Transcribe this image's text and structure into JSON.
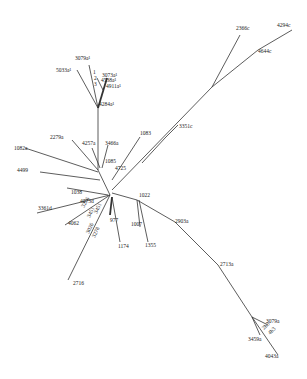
{
  "diagram": {
    "type": "unrooted-phylogenetic-tree",
    "background": "#ffffff",
    "line_color": "#333333",
    "branches": [
      {
        "id": "b-root-up",
        "x1": 98,
        "y1": 170,
        "x2": 98,
        "y2": 108
      },
      {
        "id": "b-up-5033",
        "x1": 98,
        "y1": 108,
        "x2": 77,
        "y2": 70
      },
      {
        "id": "b-up-3079",
        "x1": 98,
        "y1": 108,
        "x2": 89,
        "y2": 65
      },
      {
        "id": "b-up-clust",
        "x1": 98,
        "y1": 108,
        "x2": 107,
        "y2": 78,
        "bold": true
      },
      {
        "id": "b-clust-a",
        "x1": 103,
        "y1": 90,
        "x2": 97,
        "y2": 78
      },
      {
        "id": "b-root-2279",
        "x1": 98,
        "y1": 170,
        "x2": 72,
        "y2": 140
      },
      {
        "id": "b-root-4257",
        "x1": 100,
        "y1": 168,
        "x2": 92,
        "y2": 148
      },
      {
        "id": "b-root-3466",
        "x1": 102,
        "y1": 168,
        "x2": 108,
        "y2": 145
      },
      {
        "id": "b-root-1082",
        "x1": 98,
        "y1": 172,
        "x2": 25,
        "y2": 148
      },
      {
        "id": "b-root-4499",
        "x1": 100,
        "y1": 180,
        "x2": 40,
        "y2": 172
      },
      {
        "id": "b-root-1038",
        "x1": 108,
        "y1": 195,
        "x2": 67,
        "y2": 188
      },
      {
        "id": "b-main-left",
        "x1": 98,
        "y1": 170,
        "x2": 110,
        "y2": 195
      },
      {
        "id": "b-root-1083",
        "x1": 112,
        "y1": 180,
        "x2": 140,
        "y2": 137
      },
      {
        "id": "b-root-long",
        "x1": 112,
        "y1": 190,
        "x2": 212,
        "y2": 87
      },
      {
        "id": "b-long-2366",
        "x1": 212,
        "y1": 87,
        "x2": 240,
        "y2": 35
      },
      {
        "id": "b-long-4644",
        "x1": 212,
        "y1": 87,
        "x2": 258,
        "y2": 50
      },
      {
        "id": "b-4644-4294",
        "x1": 258,
        "y1": 50,
        "x2": 292,
        "y2": 30
      },
      {
        "id": "b-long-3351",
        "x1": 165,
        "y1": 138,
        "x2": 178,
        "y2": 125
      },
      {
        "id": "b-3351-mid",
        "x1": 165,
        "y1": 138,
        "x2": 142,
        "y2": 163
      },
      {
        "id": "b-root-3361",
        "x1": 110,
        "y1": 195,
        "x2": 37,
        "y2": 213
      },
      {
        "id": "b-root-4062",
        "x1": 110,
        "y1": 195,
        "x2": 65,
        "y2": 225
      },
      {
        "id": "b-root-2716",
        "x1": 110,
        "y1": 195,
        "x2": 68,
        "y2": 280
      },
      {
        "id": "b-root-977",
        "x1": 112,
        "y1": 197,
        "x2": 110,
        "y2": 215,
        "bold": true
      },
      {
        "id": "b-root-1174",
        "x1": 112,
        "y1": 197,
        "x2": 120,
        "y2": 242
      },
      {
        "id": "b-root-1022",
        "x1": 112,
        "y1": 193,
        "x2": 137,
        "y2": 200
      },
      {
        "id": "b-1022-1007",
        "x1": 137,
        "y1": 200,
        "x2": 140,
        "y2": 227
      },
      {
        "id": "b-1022-1355",
        "x1": 139,
        "y1": 200,
        "x2": 148,
        "y2": 242
      },
      {
        "id": "b-1022-2903",
        "x1": 137,
        "y1": 200,
        "x2": 175,
        "y2": 222
      },
      {
        "id": "b-2903-2713",
        "x1": 175,
        "y1": 222,
        "x2": 218,
        "y2": 265
      },
      {
        "id": "b-2713-tip",
        "x1": 218,
        "y1": 265,
        "x2": 252,
        "y2": 317
      },
      {
        "id": "b-tip-3079b",
        "x1": 252,
        "y1": 317,
        "x2": 268,
        "y2": 325
      },
      {
        "id": "b-tip-3459",
        "x1": 252,
        "y1": 317,
        "x2": 260,
        "y2": 335
      },
      {
        "id": "b-tip-4043",
        "x1": 252,
        "y1": 317,
        "x2": 278,
        "y2": 355
      }
    ],
    "labels": [
      {
        "text": "2366c",
        "x": 236,
        "y": 30
      },
      {
        "text": "4294c",
        "x": 277,
        "y": 27
      },
      {
        "text": "4644c",
        "x": 258,
        "y": 53
      },
      {
        "text": "3079a¹",
        "x": 75,
        "y": 60
      },
      {
        "text": "5033a¹",
        "x": 56,
        "y": 72
      },
      {
        "text": "3073a¹",
        "x": 102,
        "y": 77
      },
      {
        "text": "4538a¹",
        "x": 101,
        "y": 82
      },
      {
        "text": "4911a¹",
        "x": 106,
        "y": 88
      },
      {
        "text": "4284a¹",
        "x": 99,
        "y": 106
      },
      {
        "text": "2279a",
        "x": 50,
        "y": 139
      },
      {
        "text": "4257a",
        "x": 82,
        "y": 145
      },
      {
        "text": "3466a",
        "x": 105,
        "y": 145
      },
      {
        "text": "1083",
        "x": 140,
        "y": 135
      },
      {
        "text": "3351c",
        "x": 179,
        "y": 128
      },
      {
        "text": "1082a",
        "x": 14,
        "y": 150
      },
      {
        "text": "4499",
        "x": 17,
        "y": 172
      },
      {
        "text": "1085",
        "x": 105,
        "y": 163
      },
      {
        "text": "4725",
        "x": 115,
        "y": 170
      },
      {
        "text": "1038",
        "x": 71,
        "y": 194
      },
      {
        "text": "4073d",
        "x": 80,
        "y": 203
      },
      {
        "text": "3361d",
        "x": 38,
        "y": 210
      },
      {
        "text": "1022",
        "x": 139,
        "y": 197
      },
      {
        "text": "4062",
        "x": 68,
        "y": 225
      },
      {
        "text": "977",
        "x": 110,
        "y": 222
      },
      {
        "text": "1007",
        "x": 131,
        "y": 226
      },
      {
        "text": "1174",
        "x": 118,
        "y": 248
      },
      {
        "text": "1355",
        "x": 145,
        "y": 247
      },
      {
        "text": "2903a",
        "x": 175,
        "y": 223
      },
      {
        "text": "2713a",
        "x": 220,
        "y": 266
      },
      {
        "text": "2716",
        "x": 73,
        "y": 285
      },
      {
        "text": "3079a",
        "x": 266,
        "y": 323
      },
      {
        "text": "3459a",
        "x": 248,
        "y": 341
      },
      {
        "text": "4043a",
        "x": 265,
        "y": 358
      }
    ],
    "rotated_labels": [
      {
        "text": "3276",
        "x": 84,
        "y": 208,
        "angle": -60
      },
      {
        "text": "3451",
        "x": 90,
        "y": 218,
        "angle": -65
      },
      {
        "text": "3451",
        "x": 97,
        "y": 214,
        "angle": -65
      },
      {
        "text": "3026",
        "x": 89,
        "y": 234,
        "angle": -65
      },
      {
        "text": "3278",
        "x": 95,
        "y": 238,
        "angle": -65
      },
      {
        "text": "2b3",
        "x": 264,
        "y": 330,
        "angle": -45
      },
      {
        "text": "4b3",
        "x": 270,
        "y": 335,
        "angle": -45
      },
      {
        "text": "1",
        "x": 93,
        "y": 74,
        "angle": 0
      },
      {
        "text": "2",
        "x": 94,
        "y": 80,
        "angle": 0
      },
      {
        "text": "3",
        "x": 94,
        "y": 86,
        "angle": 0
      }
    ]
  }
}
